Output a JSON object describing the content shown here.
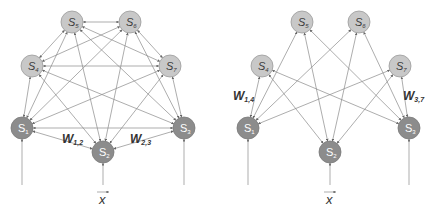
{
  "diagrams": [
    {
      "name": "fully-connected-network",
      "nodes": [
        {
          "id": "S1",
          "label": "S",
          "sub": "1",
          "type": "visible",
          "x": 22,
          "y": 128
        },
        {
          "id": "S2",
          "label": "S",
          "sub": "2",
          "type": "visible",
          "x": 103,
          "y": 152
        },
        {
          "id": "S3",
          "label": "S",
          "sub": "3",
          "type": "visible",
          "x": 184,
          "y": 128
        },
        {
          "id": "S4",
          "label": "S",
          "sub": "4",
          "type": "hidden",
          "x": 32,
          "y": 66
        },
        {
          "id": "S5",
          "label": "S",
          "sub": "5",
          "type": "hidden",
          "x": 72,
          "y": 22
        },
        {
          "id": "S6",
          "label": "S",
          "sub": "6",
          "type": "hidden",
          "x": 130,
          "y": 22
        },
        {
          "id": "S7",
          "label": "S",
          "sub": "7",
          "type": "hidden",
          "x": 170,
          "y": 66
        }
      ],
      "weights": [
        {
          "label": "W",
          "sub": "1,2",
          "x": 62,
          "y": 143
        },
        {
          "label": "W",
          "sub": "2,3",
          "x": 130,
          "y": 143
        }
      ],
      "input": {
        "label": "x",
        "x": 103,
        "y": 196
      }
    },
    {
      "name": "restricted-network",
      "nodes": [
        {
          "id": "S1",
          "label": "S",
          "sub": "1",
          "type": "visible",
          "x": 248,
          "y": 128
        },
        {
          "id": "S2",
          "label": "S",
          "sub": "2",
          "type": "visible",
          "x": 330,
          "y": 152
        },
        {
          "id": "S3",
          "label": "S",
          "sub": "3",
          "type": "visible",
          "x": 409,
          "y": 128
        },
        {
          "id": "S4",
          "label": "S",
          "sub": "4",
          "type": "hidden",
          "x": 262,
          "y": 66
        },
        {
          "id": "S5",
          "label": "S",
          "sub": "5",
          "type": "hidden",
          "x": 302,
          "y": 22
        },
        {
          "id": "S6",
          "label": "S",
          "sub": "6",
          "type": "hidden",
          "x": 359,
          "y": 22
        },
        {
          "id": "S7",
          "label": "S",
          "sub": "7",
          "type": "hidden",
          "x": 400,
          "y": 66
        }
      ],
      "weights": [
        {
          "label": "W",
          "sub": "1,4",
          "x": 233,
          "y": 100
        },
        {
          "label": "W",
          "sub": "3,7",
          "x": 403,
          "y": 100
        }
      ],
      "input": {
        "label": "x",
        "x": 330,
        "y": 196
      }
    }
  ],
  "colors": {
    "hidden_node_fill": "#c8c8c8",
    "visible_node_fill": "#8c8c8c",
    "edge": "#8a8a8a"
  }
}
